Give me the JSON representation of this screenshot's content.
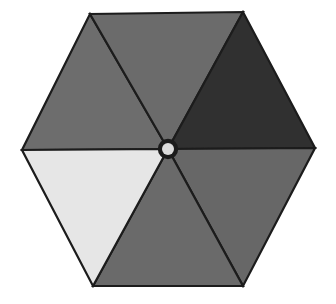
{
  "scene": {
    "title": "Umbrella top view",
    "subject": "hexagonal parasol canopy seen from directly above",
    "background_color": "#ffffff",
    "outline_color": "#1c1c1c",
    "width": 336,
    "height": 304
  },
  "geometry": {
    "shape": "hexagon",
    "sector_count": 6,
    "center": {
      "x": 168,
      "y": 149
    },
    "hub_outer_radius": 9,
    "hub_inner_radius": 6,
    "vertices": [
      {
        "name": "top-left",
        "x": 90,
        "y": 14
      },
      {
        "name": "top-right",
        "x": 243,
        "y": 12
      },
      {
        "name": "right",
        "x": 315,
        "y": 148
      },
      {
        "name": "bottom-right",
        "x": 243,
        "y": 286
      },
      {
        "name": "bottom-left",
        "x": 93,
        "y": 286
      },
      {
        "name": "left",
        "x": 22,
        "y": 150
      }
    ]
  },
  "sectors": [
    {
      "id": "sector-top-left",
      "label": "upper left panel",
      "color": "#6d6d6d",
      "tone": "medium-dark gray",
      "points": "168,149 22,150 90,14"
    },
    {
      "id": "sector-top-center",
      "label": "upper center panel",
      "color": "#6b6b6b",
      "tone": "medium-dark gray",
      "points": "168,149 90,14 243,12"
    },
    {
      "id": "sector-top-right",
      "label": "upper right panel",
      "color": "#303030",
      "tone": "very dark gray",
      "points": "168,149 243,12 315,148"
    },
    {
      "id": "sector-bottom-right",
      "label": "lower right panel",
      "color": "#676767",
      "tone": "medium gray",
      "points": "168,149 315,148 243,286"
    },
    {
      "id": "sector-bottom-center",
      "label": "lower center panel",
      "color": "#6a6a6a",
      "tone": "medium gray",
      "points": "168,149 243,286 93,286"
    },
    {
      "id": "sector-bottom-left",
      "label": "lower left panel",
      "color": "#e6e6e6",
      "tone": "very light gray",
      "points": "168,149 93,286 22,150"
    }
  ],
  "hub": {
    "id": "center-hub",
    "label": "center hub cap",
    "outer_color": "#1c1c1c",
    "inner_color": "#dcdcdc"
  }
}
